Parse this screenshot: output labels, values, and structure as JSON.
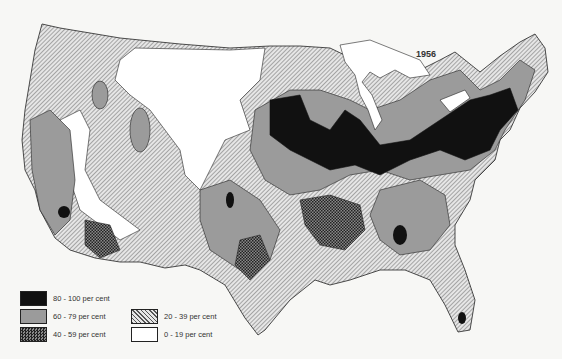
{
  "map": {
    "title_year": "1956",
    "region": "United States (contiguous)",
    "legend": [
      {
        "label": "80 - 100 per cent",
        "fill": "#111111",
        "pattern": "solid-black"
      },
      {
        "label": "60 - 79 per cent",
        "fill": "#9a9a9a",
        "pattern": "solid-grey"
      },
      {
        "label": "40 - 59 per cent",
        "fill": "#444444",
        "pattern": "crosshatch"
      },
      {
        "label": "20 - 39 per cent",
        "fill": "#bbbbbb",
        "pattern": "diagonal-hatch"
      },
      {
        "label": "0 - 19 per cent",
        "fill": "#ffffff",
        "pattern": "white"
      }
    ]
  }
}
